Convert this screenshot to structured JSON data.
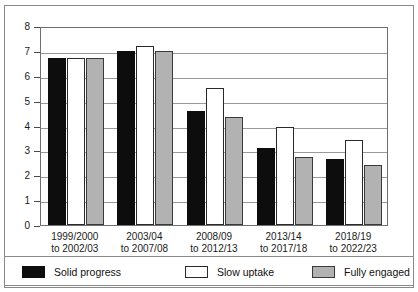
{
  "chart_data": {
    "type": "bar",
    "title": "",
    "xlabel": "",
    "ylabel": "",
    "ylim": [
      0,
      8
    ],
    "yticks": [
      0,
      1,
      2,
      3,
      4,
      5,
      6,
      7,
      8
    ],
    "grid": true,
    "legend_position": "bottom",
    "categories": [
      "1999/2000 to 2002/03",
      "2003/04 to 2007/08",
      "2008/09 to 2012/13",
      "2013/14 to 2017/18",
      "2018/19 to 2022/23"
    ],
    "category_lines": [
      {
        "line1": "1999/2000",
        "line2": "to 2002/03"
      },
      {
        "line1": "2003/04",
        "line2": "to 2007/08"
      },
      {
        "line1": "2008/09",
        "line2": "to 2012/13"
      },
      {
        "line1": "2013/14",
        "line2": "to 2017/18"
      },
      {
        "line1": "2018/19",
        "line2": "to 2022/23"
      }
    ],
    "series": [
      {
        "name": "Solid progress",
        "color": "#0d0d0d",
        "values": [
          6.7,
          7.0,
          4.6,
          3.1,
          2.65
        ]
      },
      {
        "name": "Slow uptake",
        "color": "#ffffff",
        "values": [
          6.7,
          7.2,
          5.5,
          3.95,
          3.4
        ]
      },
      {
        "name": "Fully engaged",
        "color": "#b2b2b2",
        "values": [
          6.7,
          7.0,
          4.35,
          2.75,
          2.4
        ]
      }
    ]
  },
  "legend": {
    "items": [
      {
        "label": "Solid progress"
      },
      {
        "label": "Slow uptake"
      },
      {
        "label": "Fully engaged"
      }
    ]
  }
}
